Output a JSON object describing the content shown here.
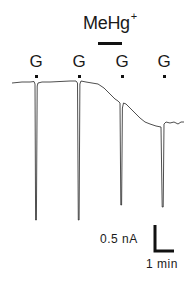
{
  "figure": {
    "drug": {
      "label": "MeHg",
      "superscript": "+"
    },
    "stimulus_markers": [
      {
        "label": "G",
        "x": 36
      },
      {
        "label": "G",
        "x": 79
      },
      {
        "label": "G",
        "x": 122
      },
      {
        "label": "G",
        "x": 164
      }
    ],
    "scale_bar": {
      "vertical_label": "0.5 nA",
      "horizontal_label": "1 min"
    },
    "colors": {
      "ink": "#111111",
      "background": "#ffffff"
    }
  }
}
